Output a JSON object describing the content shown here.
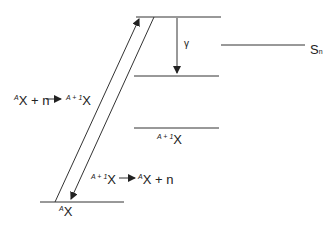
{
  "diagram": {
    "type": "nuclear energy level diagram (neutron capture and emission)",
    "levels": [
      {
        "id": "capture-state",
        "label": ""
      },
      {
        "id": "separation-energy",
        "label_main": "S",
        "label_sub": "n"
      },
      {
        "id": "intermediate-state",
        "label": ""
      },
      {
        "id": "compound-ground",
        "label_sup": "A + 1",
        "label_main": "X"
      },
      {
        "id": "target-ground",
        "label_sup": "A",
        "label_main": "X"
      }
    ],
    "transitions": {
      "capture": {
        "sup1": "A",
        "x1": "X + n",
        "arrow": "→",
        "sup2": "A + 1",
        "x2": "X"
      },
      "emission": {
        "sup1": "A + 1",
        "x1": "X",
        "arrow": "→",
        "sup2": "A",
        "x2": "X + n"
      },
      "gamma": {
        "label": "γ"
      }
    }
  }
}
